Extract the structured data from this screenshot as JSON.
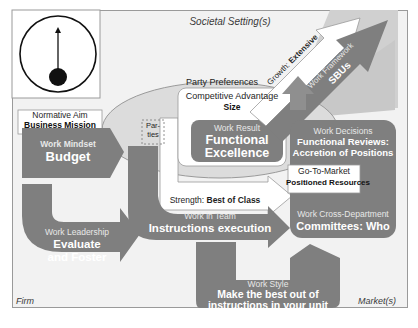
{
  "diagram": {
    "corner_labels": {
      "top": "Societal Setting(s)",
      "bottom_left": "Firm",
      "bottom_right": "Market(s)"
    },
    "icon": "pendulum-clock-icon",
    "ellipse_label": "Party Preferences",
    "parties_box": "Par-\nties",
    "normative_aim": {
      "label": "Normative Aim",
      "value": "Business Mission"
    },
    "competitive_advantage": {
      "label": "Competitive Advantage",
      "value": "Size"
    },
    "growth": {
      "label": "Growth:",
      "value": "Extensive"
    },
    "work_framework": {
      "label": "Work Framework",
      "value": "SBUs"
    },
    "work_mindset": {
      "label": "Work Mindset",
      "value": "Budget"
    },
    "work_result": {
      "label": "Work Result",
      "value_line1": "Functional",
      "value_line2": "Excellence"
    },
    "work_decisions": {
      "label": "Work Decisions",
      "value_line1": "Functional Reviews:",
      "value_line2": "Accretion of Positions"
    },
    "go_to_market": {
      "label": "Go-To-Market",
      "value": "Positioned Resources"
    },
    "strength": {
      "label": "Strength:",
      "value": "Best of Class"
    },
    "work_in_team": {
      "label": "Work in Team",
      "value": "Instructions execution"
    },
    "work_cross_department": {
      "label": "Work Cross-Department",
      "value": "Committees: Who"
    },
    "work_leadership": {
      "label": "Work Leadership",
      "value_line1": "Evaluate",
      "value_line2": "and Foster"
    },
    "work_style": {
      "label": "Work Style",
      "value_line1": "Make the best out of",
      "value_line2": "instructions in your unit"
    },
    "colors": {
      "background": "#f2f2f2",
      "dark_shape": "#7f7f7f",
      "mid_shape": "#a6a6a6",
      "light_shape": "#d9d9d9",
      "white_arrow": "#ffffff"
    }
  }
}
